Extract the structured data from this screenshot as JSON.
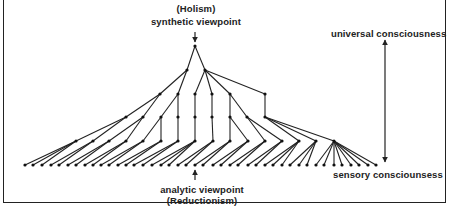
{
  "labels": {
    "top_line1": "(Holism)",
    "top_line2": "synthetic viewpoint",
    "bottom_line1": "analytic viewpoint",
    "bottom_line2": "(Reductionism)",
    "scale_top": "universal consciousness",
    "scale_bottom": "sensory consciounsess"
  },
  "colors": {
    "line": "#222222",
    "node": "#111111",
    "background": "#ffffff"
  },
  "tree": {
    "root": {
      "x": 195,
      "y": 46
    },
    "levels": [
      {
        "y": 70,
        "xs": [
          187,
          205
        ]
      },
      {
        "y": 94,
        "xs": [
          160,
          178,
          195,
          212,
          230,
          265
        ]
      },
      {
        "y": 117,
        "xs": [
          126,
          143,
          161,
          178,
          195,
          212,
          230,
          247,
          265
        ]
      },
      {
        "y": 141,
        "xs": [
          76,
          93,
          109,
          126,
          143,
          161,
          178,
          195,
          213,
          230,
          248,
          265,
          282,
          299,
          316,
          334
        ]
      },
      {
        "y": 165,
        "xs": [
          25,
          33,
          42,
          51,
          59,
          68,
          76,
          85,
          93,
          101,
          109,
          118,
          126,
          134,
          143,
          152,
          161,
          169,
          178,
          186,
          195,
          203,
          213,
          221,
          230,
          238,
          248,
          256,
          265,
          273,
          282,
          290,
          299,
          307,
          316,
          324,
          334,
          342,
          351,
          359,
          368,
          376
        ]
      }
    ],
    "edges": [
      [
        0,
        0,
        1,
        0
      ],
      [
        0,
        0,
        1,
        1
      ],
      [
        1,
        0,
        2,
        0
      ],
      [
        1,
        0,
        2,
        1
      ],
      [
        1,
        1,
        2,
        2
      ],
      [
        1,
        1,
        2,
        3
      ],
      [
        1,
        1,
        2,
        4
      ],
      [
        1,
        1,
        2,
        5
      ],
      [
        2,
        0,
        3,
        0
      ],
      [
        2,
        0,
        3,
        1
      ],
      [
        2,
        1,
        3,
        2
      ],
      [
        2,
        1,
        3,
        3
      ],
      [
        2,
        2,
        3,
        4
      ],
      [
        2,
        3,
        3,
        5
      ],
      [
        2,
        4,
        3,
        6
      ],
      [
        2,
        4,
        3,
        7
      ],
      [
        2,
        5,
        3,
        8
      ],
      [
        3,
        0,
        4,
        0
      ],
      [
        3,
        0,
        4,
        1
      ],
      [
        3,
        1,
        4,
        2
      ],
      [
        3,
        1,
        4,
        3
      ],
      [
        3,
        2,
        4,
        4
      ],
      [
        3,
        2,
        4,
        5
      ],
      [
        3,
        3,
        4,
        6
      ],
      [
        3,
        4,
        4,
        7
      ],
      [
        3,
        5,
        4,
        8
      ],
      [
        3,
        6,
        4,
        9
      ],
      [
        3,
        6,
        4,
        10
      ],
      [
        3,
        7,
        4,
        11
      ],
      [
        3,
        7,
        4,
        12
      ],
      [
        3,
        8,
        4,
        13
      ],
      [
        3,
        8,
        4,
        14
      ],
      [
        3,
        8,
        4,
        15
      ],
      [
        4,
        0,
        5,
        0
      ],
      [
        4,
        0,
        5,
        1
      ],
      [
        4,
        0,
        5,
        2
      ],
      [
        4,
        1,
        5,
        3
      ],
      [
        4,
        1,
        5,
        4
      ],
      [
        4,
        2,
        5,
        5
      ],
      [
        4,
        2,
        5,
        6
      ],
      [
        4,
        3,
        5,
        7
      ],
      [
        4,
        3,
        5,
        8
      ],
      [
        4,
        4,
        5,
        9
      ],
      [
        4,
        4,
        5,
        10
      ],
      [
        4,
        5,
        5,
        11
      ],
      [
        4,
        5,
        5,
        12
      ],
      [
        4,
        6,
        5,
        13
      ],
      [
        4,
        6,
        5,
        14
      ],
      [
        4,
        7,
        5,
        15
      ],
      [
        4,
        7,
        5,
        16
      ],
      [
        4,
        7,
        5,
        17
      ],
      [
        4,
        8,
        5,
        18
      ],
      [
        4,
        8,
        5,
        19
      ],
      [
        4,
        9,
        5,
        20
      ],
      [
        4,
        9,
        5,
        21
      ],
      [
        4,
        10,
        5,
        22
      ],
      [
        4,
        10,
        5,
        23
      ],
      [
        4,
        11,
        5,
        24
      ],
      [
        4,
        11,
        5,
        25
      ],
      [
        4,
        12,
        5,
        26
      ],
      [
        4,
        12,
        5,
        27
      ],
      [
        4,
        13,
        5,
        28
      ],
      [
        4,
        13,
        5,
        29
      ],
      [
        4,
        13,
        5,
        30
      ],
      [
        4,
        14,
        5,
        31
      ],
      [
        4,
        14,
        5,
        32
      ],
      [
        4,
        14,
        5,
        33
      ],
      [
        4,
        15,
        5,
        34
      ],
      [
        4,
        15,
        5,
        35
      ],
      [
        4,
        15,
        5,
        36
      ],
      [
        4,
        15,
        5,
        37
      ],
      [
        4,
        15,
        5,
        38
      ],
      [
        4,
        15,
        5,
        39
      ],
      [
        4,
        15,
        5,
        40
      ],
      [
        4,
        15,
        5,
        41
      ]
    ]
  },
  "arrows": {
    "top_arrow": {
      "x": 195,
      "y1": 32,
      "y2": 42
    },
    "bottom_arrow": {
      "x": 195,
      "y1": 180,
      "y2": 170
    },
    "scale_arrow": {
      "x": 385,
      "y1": 40,
      "y2": 162
    }
  }
}
